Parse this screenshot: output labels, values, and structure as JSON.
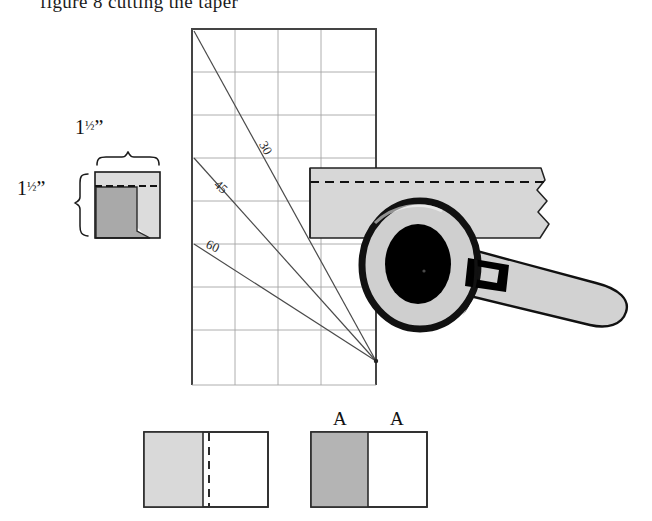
{
  "figure": {
    "caption_cut": "figure 8 cutting the taper",
    "domain": "technical-illustration",
    "title_visible": false
  },
  "detail_callout": {
    "width_label": "1½\"",
    "height_label": "1½\"",
    "width_number": "1",
    "width_fraction": "½",
    "width_unit": "\"",
    "height_number": "1",
    "height_fraction": "½",
    "height_unit": "\"",
    "square": {
      "fill": "#d8d8d8",
      "dark_fill": "#a9a9a9",
      "stroke": "#111111",
      "has_dashed_line": true
    }
  },
  "grid_panel": {
    "cols": 4,
    "rows": 8,
    "cell_size_px": 43,
    "grid_color": "#9a9a9a",
    "border_color": "#3a3a3a",
    "angle_lines": [
      {
        "label": "30",
        "label_rotation_deg": 58
      },
      {
        "label": "45",
        "label_rotation_deg": 38
      },
      {
        "label": "60",
        "label_rotation_deg": 22
      }
    ],
    "apex_note": "lines converge at lower right corner of grid"
  },
  "workpiece_bar": {
    "fill": "#d5d5d5",
    "stroke": "#222222",
    "dashed_center_line": true,
    "broken_edge": true
  },
  "wrench": {
    "name": "open-end-ring-wrench",
    "head_fill": "#cfcfcf",
    "handle_fill": "#d0d0d0",
    "outline": "#000000",
    "hole_fill": "#000000",
    "slot_fill": "#000000"
  },
  "bottom_figures": [
    {
      "name": "left-board-diagram",
      "light_fill": "#d9d9d9",
      "stroke": "#2b2b2b",
      "divider_solid": true,
      "divider_dashed": true,
      "labels": []
    },
    {
      "name": "right-board-diagram",
      "light_fill": "#b2b2b2",
      "stroke": "#2b2b2b",
      "divider_solid": true,
      "divider_dashed": false,
      "labels": [
        "A",
        "A"
      ]
    }
  ],
  "palette": {
    "paper": "#ffffff",
    "light_gray": "#d8d8d8",
    "mid_gray": "#b2b2b2",
    "dark_gray": "#a9a9a9",
    "ink": "#111111",
    "grid": "#9a9a9a"
  }
}
